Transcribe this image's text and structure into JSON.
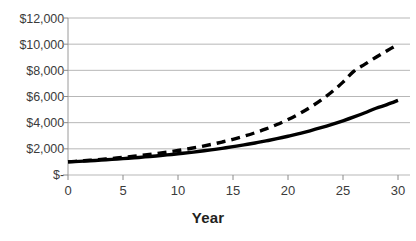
{
  "chart_data": {
    "type": "line",
    "title": "",
    "xlabel": "Year",
    "ylabel": "",
    "xlim": [
      0,
      30
    ],
    "ylim": [
      0,
      12000
    ],
    "grid": true,
    "legend": "none",
    "x_ticks": [
      "0",
      "5",
      "10",
      "15",
      "20",
      "25",
      "30"
    ],
    "x_tick_values": [
      0,
      5,
      10,
      15,
      20,
      25,
      30
    ],
    "y_ticks": [
      "$-",
      "$2,000",
      "$4,000",
      "$6,000",
      "$8,000",
      "$10,000",
      "$12,000"
    ],
    "y_tick_values": [
      0,
      2000,
      4000,
      6000,
      8000,
      10000,
      12000
    ],
    "x": [
      0,
      1,
      2,
      3,
      4,
      5,
      6,
      7,
      8,
      9,
      10,
      11,
      12,
      13,
      14,
      15,
      16,
      17,
      18,
      19,
      20,
      21,
      22,
      23,
      24,
      25,
      26,
      27,
      28,
      29,
      30
    ],
    "series": [
      {
        "name": "solid-curve",
        "style": "solid",
        "color": "#000000",
        "width": 3.4,
        "values": [
          1000,
          1042,
          1088,
          1138,
          1192,
          1250,
          1313,
          1381,
          1455,
          1534,
          1620,
          1713,
          1813,
          1921,
          2038,
          2164,
          2300,
          2447,
          2606,
          2778,
          2963,
          3163,
          3379,
          3613,
          3866,
          4140,
          4436,
          4757,
          5104,
          5380,
          5700
        ]
      },
      {
        "name": "dashed-curve",
        "style": "dashed",
        "color": "#000000",
        "width": 3.4,
        "dash": "9,6",
        "values": [
          1000,
          1060,
          1124,
          1193,
          1267,
          1347,
          1434,
          1529,
          1633,
          1747,
          1872,
          2010,
          2162,
          2331,
          2519,
          2728,
          2963,
          3227,
          3524,
          3860,
          4240,
          4672,
          5163,
          5724,
          6365,
          7098,
          7937,
          8470,
          9000,
          9500,
          9980
        ]
      }
    ]
  },
  "axes": {
    "x_title": "Year"
  }
}
